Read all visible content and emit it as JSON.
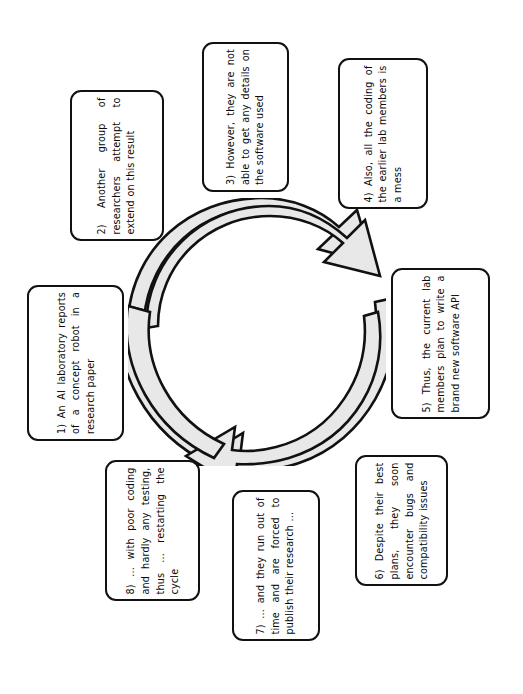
{
  "diagram": {
    "background_color": "#ffffff",
    "outline_color": "#111111",
    "arrow_fill_color": "#e8e8e8",
    "text_color": "#0a0a0a",
    "text_rotation_degrees": -90,
    "center_graphic": {
      "name": "three-arrow-cycle",
      "arrow_count": 3,
      "direction": "clockwise"
    },
    "steps": [
      {
        "number": "1)",
        "text": "1) An AI laboratory reports of a concept robot in a research paper"
      },
      {
        "number": "2)",
        "text": "2) Another group of researchers attempt to extend on this result"
      },
      {
        "number": "3)",
        "text": "3) However, they are not able to get any details on the software used"
      },
      {
        "number": "4)",
        "text": "4) Also, all the coding of the earlier lab members is a mess"
      },
      {
        "number": "5)",
        "text": "5) Thus, the current lab members plan to write a brand new software API"
      },
      {
        "number": "6)",
        "text": "6) Despite their best plans, they soon encounter bugs and compatibility issues"
      },
      {
        "number": "7)",
        "text": "7) ... and they run out of time and are forced to publish their research ..."
      },
      {
        "number": "8)",
        "text": "8) ... with poor coding and hardly any testing, thus ... restarting the cycle"
      }
    ]
  }
}
